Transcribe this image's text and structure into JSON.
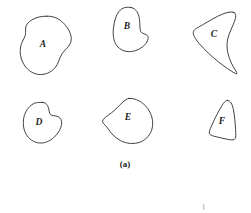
{
  "figure": {
    "caption": "(a)",
    "background_color": "#ffffff",
    "stroke_color": "#2b2b2b",
    "label_color": "#1c1c1c",
    "width": 251,
    "height": 213,
    "shapes": [
      {
        "id": "shape-a",
        "label": "A",
        "label_x": 43,
        "label_y": 45,
        "row": 1,
        "column": 1,
        "description": "large rounded irregular blob with shallow concave notch on left side",
        "path": "M 46.5 16.2 C 55.0 15.6 62.0 20.4 66.5 26.6 C 70.8 32.4 72.4 38.4 70.4 43.2 C 68.6 47.6 64.4 50.0 62.0 53.8 C 59.2 58.2 58.6 63.4 55.0 67.8 C 51.2 72.4 44.6 75.2 38.4 74.4 C 31.8 73.6 26.2 69.0 23.0 62.8 C 19.8 56.6 19.4 49.2 21.6 43.4 C 22.8 40.2 24.8 37.6 25.4 34.6 C 26.0 31.6 25.0 28.6 26.2 25.8 C 28.0 21.4 33.6 18.4 39.0 17.0 C 41.4 16.4 44.0 16.4 46.5 16.2 Z"
      },
      {
        "id": "shape-b",
        "label": "B",
        "label_x": 127,
        "label_y": 27,
        "row": 1,
        "column": 2,
        "description": "bean or kidney shape with concave indentation on right side",
        "path": "M 131.5 7.6 C 136.2 8.6 138.6 13.4 139.4 18.6 C 140.2 23.8 139.4 29.0 140.8 31.6 C 142.2 34.2 145.8 33.6 147.4 35.6 C 149.0 37.6 148.0 41.2 145.2 44.4 C 142.0 48.0 136.8 51.0 131.4 51.6 C 125.4 52.2 119.8 49.8 116.6 45.4 C 113.4 41.0 112.8 34.8 113.4 28.6 C 114.0 22.0 115.8 15.4 119.0 11.4 C 122.2 7.4 126.8 6.6 131.5 7.6 Z"
      },
      {
        "id": "shape-c",
        "label": "C",
        "label_x": 214,
        "label_y": 35,
        "row": 1,
        "column": 3,
        "description": "crescent or wedge shape with strongly concave right edge and pointed bottom tip",
        "path": "M 234.0 12.4 C 236.6 13.6 236.0 17.2 234.4 21.6 C 232.4 27.0 229.2 32.6 227.8 38.6 C 226.2 45.4 227.2 52.4 229.6 58.8 C 231.8 64.8 234.8 69.4 236.6 72.2 C 237.4 73.4 236.6 74.2 235.2 73.4 C 231.2 71.2 224.8 67.0 218.4 61.8 C 211.4 56.2 204.4 49.6 199.4 43.8 C 195.0 38.6 192.6 34.2 193.4 31.6 C 194.2 29.0 198.2 27.4 203.4 24.4 C 209.2 21.0 216.2 16.6 222.4 14.2 C 227.0 12.4 231.4 11.2 234.0 12.4 Z"
      },
      {
        "id": "shape-d",
        "label": "D",
        "label_x": 39,
        "label_y": 123,
        "row": 2,
        "column": 1,
        "description": "small rounded blob with concave notch on the right side",
        "path": "M 42.0 102.4 C 45.4 102.0 47.4 104.6 48.4 107.8 C 49.2 110.4 49.2 113.2 50.6 114.6 C 52.2 116.2 55.4 115.4 58.0 116.6 C 60.6 117.8 62.2 120.6 61.6 124.4 C 61.0 128.4 58.4 133.2 54.4 137.0 C 50.2 141.0 44.8 143.4 39.6 143.0 C 33.8 142.6 28.6 139.0 25.8 133.6 C 23.0 128.2 22.6 121.2 24.4 115.4 C 26.2 109.6 30.2 105.0 34.6 103.2 C 37.2 102.2 39.8 102.6 42.0 102.4 Z"
      },
      {
        "id": "shape-e",
        "label": "E",
        "label_x": 128,
        "label_y": 118,
        "row": 2,
        "column": 2,
        "description": "rounded triangular blob with slight concavity at lower left",
        "path": "M 129.0 98.4 C 136.0 98.0 143.0 102.2 147.6 108.4 C 152.0 114.4 153.6 121.6 152.2 128.0 C 150.8 134.4 146.4 139.6 140.4 142.0 C 134.2 144.4 126.6 143.8 120.4 140.6 C 114.6 137.6 110.4 132.4 108.0 128.6 C 106.2 125.8 104.2 124.6 103.2 123.2 C 102.2 121.8 102.4 120.2 104.2 118.4 C 106.4 116.2 110.6 113.8 114.4 110.4 C 118.4 106.8 122.0 102.2 126.0 99.6 C 127.0 98.8 128.0 98.4 129.0 98.4 Z"
      },
      {
        "id": "shape-f",
        "label": "F",
        "label_x": 222,
        "label_y": 122,
        "row": 2,
        "column": 3,
        "description": "narrow tall wedge or triangular shape",
        "path": "M 227.4 100.4 C 230.6 100.6 232.2 104.0 233.4 109.6 C 234.6 115.4 235.2 123.2 235.6 129.6 C 235.8 134.0 236.0 137.2 235.2 138.6 C 234.4 140.0 232.4 140.2 228.8 139.6 C 224.4 138.8 218.0 137.2 214.0 136.2 C 211.2 135.4 209.8 134.6 209.4 133.2 C 209.0 131.8 209.8 129.8 211.4 126.2 C 213.4 121.6 216.4 115.2 219.4 110.0 C 222.2 105.2 224.8 100.2 227.4 100.4 Z"
      }
    ],
    "caption_x": 125,
    "caption_y": 165,
    "artifact": {
      "name": "scan-artifact-tick",
      "x": 203,
      "y": 204,
      "width": 1.4,
      "height": 6
    }
  }
}
